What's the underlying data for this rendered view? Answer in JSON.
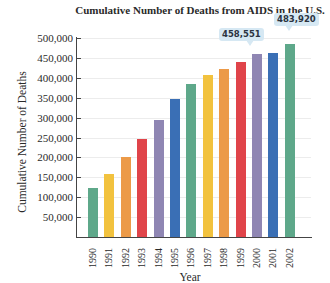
{
  "chart_data": {
    "type": "bar",
    "title": "Cumulative Number of Deaths from AIDS in the U.S.",
    "xlabel": "Year",
    "ylabel": "Cumulative Number of Deaths",
    "ylim": [
      0,
      500000
    ],
    "grid": true,
    "legend": null,
    "yticks": [
      "50,000",
      "100,000",
      "150,000",
      "200,000",
      "250,000",
      "300,000",
      "350,000",
      "400,000",
      "450,000",
      "500,000"
    ],
    "categories": [
      "1990",
      "1991",
      "1992",
      "1993",
      "1994",
      "1995",
      "1996",
      "1997",
      "1998",
      "1999",
      "2000",
      "2001",
      "2002"
    ],
    "values": [
      122000,
      158000,
      200000,
      245000,
      295000,
      347000,
      385000,
      406000,
      423000,
      440000,
      458551,
      462000,
      483920
    ],
    "colors": [
      "#5ea88a",
      "#f2c23e",
      "#ec9a48",
      "#e0444a",
      "#8f86b3",
      "#3a6fb5",
      "#5ea88a",
      "#f2c23e",
      "#ec9a48",
      "#e0444a",
      "#8f86b3",
      "#3a6fb5",
      "#5ea88a"
    ],
    "annotations": [
      {
        "category": "2000",
        "text": "458,551"
      },
      {
        "category": "2002",
        "text": "483,920"
      }
    ]
  },
  "callouts": {
    "c2000": "458,551",
    "c2002": "483,920"
  }
}
